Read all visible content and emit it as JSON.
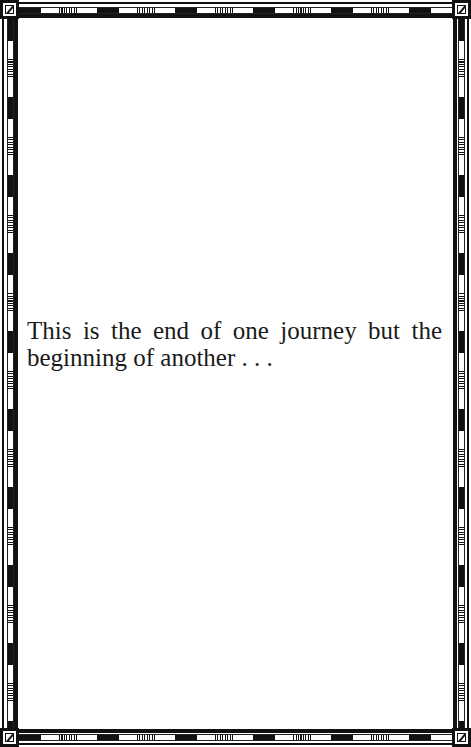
{
  "page": {
    "text_lines": [
      "This is the end of one journey but the",
      "beginning of another . . ."
    ],
    "full_text": "This is the end of one journey but the beginning of another . . ."
  },
  "frame": {
    "style": "decorative-border",
    "line_color": "#111111",
    "background": "#ffffff",
    "corner_icon": "square-diagonal-glyph",
    "segment_pattern": [
      "solid-black",
      "white",
      "hatched",
      "white"
    ]
  }
}
